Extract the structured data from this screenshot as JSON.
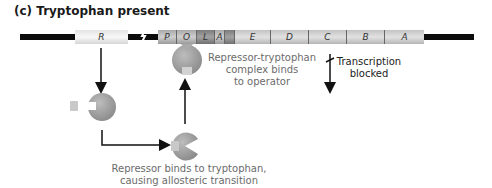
{
  "title": "(c) Tryptophan present",
  "genes": {
    "regulator": "R",
    "promoter": "P",
    "operator": "O",
    "leader": "L",
    "attenuator": "A",
    "structural": [
      "E",
      "D",
      "C",
      "B",
      "A"
    ]
  },
  "labels": {
    "complex_binds": [
      "Repressor-tryptophan",
      "complex binds",
      "to operator"
    ],
    "transcription": [
      "Transcription",
      "blocked"
    ],
    "allosteric": [
      "Repressor binds to tryptophan,",
      "causing allosteric transition"
    ]
  },
  "colors": {
    "repressor": "#9a9a9a",
    "tryptophan": "#c8c8c8",
    "dna": "#0c0c0c"
  }
}
